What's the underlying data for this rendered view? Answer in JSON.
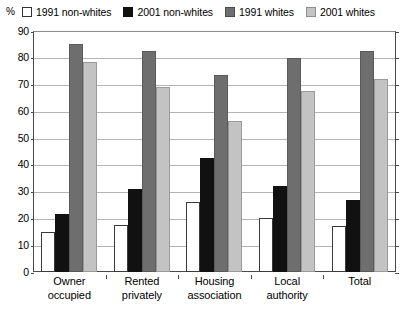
{
  "axis": {
    "unit_label": "%",
    "y_ticks": [
      0,
      10,
      20,
      30,
      40,
      50,
      60,
      70,
      80,
      90
    ],
    "y_min": 0,
    "y_max": 90,
    "ylabel": "%",
    "xlabel": ""
  },
  "legend": {
    "items": [
      {
        "label": "1991 non-whites",
        "color": "#ffffff"
      },
      {
        "label": "2001 non-whites",
        "color": "#111111"
      },
      {
        "label": "1991 whites",
        "color": "#6e6e6e"
      },
      {
        "label": "2001 whites",
        "color": "#c3c3c3"
      }
    ]
  },
  "categories": [
    {
      "line1": "Owner",
      "line2": "occupied"
    },
    {
      "line1": "Rented",
      "line2": "privately"
    },
    {
      "line1": "Housing",
      "line2": "association"
    },
    {
      "line1": "Local",
      "line2": "authority"
    },
    {
      "line1": "Total",
      "line2": ""
    }
  ],
  "chart_data": {
    "type": "bar",
    "title": "",
    "xlabel": "",
    "ylabel": "%",
    "ylim": [
      0,
      90
    ],
    "yticks": [
      0,
      10,
      20,
      30,
      40,
      50,
      60,
      70,
      80,
      90
    ],
    "grid": true,
    "legend_position": "top",
    "categories": [
      "Owner occupied",
      "Rented privately",
      "Housing association",
      "Local authority",
      "Total"
    ],
    "series": [
      {
        "name": "1991 non-whites",
        "color": "#ffffff",
        "values": [
          15,
          17.5,
          26,
          20,
          17
        ]
      },
      {
        "name": "2001 non-whites",
        "color": "#111111",
        "values": [
          21.5,
          31,
          42.5,
          32,
          27
        ]
      },
      {
        "name": "1991 whites",
        "color": "#6e6e6e",
        "values": [
          85,
          82.5,
          73.5,
          80,
          82.5
        ]
      },
      {
        "name": "2001 whites",
        "color": "#c3c3c3",
        "values": [
          78.5,
          69,
          56.5,
          67.5,
          72
        ]
      }
    ]
  }
}
